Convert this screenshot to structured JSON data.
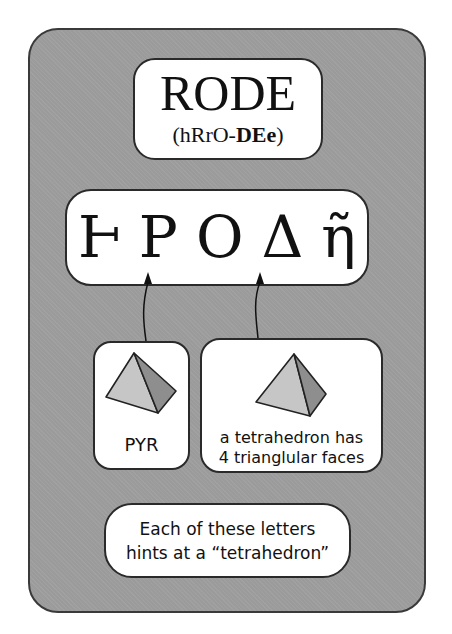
{
  "word": {
    "title": "RODE",
    "pronunciation_prefix": "(hRrO-",
    "pronunciation_bold": "DEe",
    "pronunciation_suffix": ")"
  },
  "glyphs": [
    "Ⱶ",
    "P",
    "O",
    "Δ",
    "ῆ"
  ],
  "hints": [
    {
      "label": "PYR",
      "icon": "tetrahedron-icon",
      "points_to_glyph": 1
    },
    {
      "label_line1": "a tetrahedron has",
      "label_line2": "4 trianglular faces",
      "icon": "tetrahedron-icon",
      "points_to_glyph": 3
    }
  ],
  "footer": {
    "line1": "Each of these letters",
    "line2": "hints at a “tetrahedron”"
  },
  "colors": {
    "card_bg": "#9b9b9b",
    "box_bg": "#ffffff",
    "outline": "#2a2a2a",
    "face_light": "#c8c8c8",
    "face_dark": "#8e8e8e"
  }
}
